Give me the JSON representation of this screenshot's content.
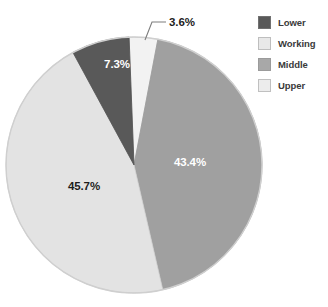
{
  "chart_data": {
    "type": "pie",
    "title": "",
    "categories": [
      "Lower",
      "Working",
      "Middle",
      "Upper"
    ],
    "values": [
      7.3,
      45.7,
      43.4,
      3.6
    ],
    "value_unit": "%",
    "data_labels": [
      "7.3%",
      "45.7%",
      "43.4%",
      "3.6%"
    ],
    "colors": [
      "#595959",
      "#e3e3e3",
      "#a0a0a0",
      "#f2f2f2"
    ],
    "legend_position": "right",
    "grid": false,
    "slices": [
      {
        "name": "Upper",
        "value": 3.6,
        "label": "3.6%",
        "color": "#f2f2f2",
        "label_placement": "outside",
        "label_color": "#1d1d1d"
      },
      {
        "name": "Middle",
        "value": 43.4,
        "label": "43.4%",
        "color": "#a0a0a0",
        "label_placement": "inside",
        "label_color": "#ffffff"
      },
      {
        "name": "Working",
        "value": 45.7,
        "label": "45.7%",
        "color": "#e3e3e3",
        "label_placement": "inside",
        "label_color": "#1d1d1d"
      },
      {
        "name": "Lower",
        "value": 7.3,
        "label": "7.3%",
        "color": "#595959",
        "label_placement": "inside",
        "label_color": "#ffffff"
      }
    ]
  },
  "legend": {
    "items": [
      {
        "label": "Lower",
        "color": "#595959"
      },
      {
        "label": "Working",
        "color": "#e8e8e8"
      },
      {
        "label": "Middle",
        "color": "#a8a8a8"
      },
      {
        "label": "Upper",
        "color": "#ececec"
      }
    ]
  },
  "labels": {
    "upper": "3.6%",
    "middle": "43.4%",
    "working": "45.7%",
    "lower": "7.3%"
  },
  "style": {
    "outline_color": "#cfcfcf",
    "background": "#ffffff"
  }
}
